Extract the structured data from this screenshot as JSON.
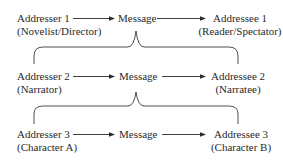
{
  "diagram": {
    "title": "",
    "levels": [
      {
        "addresser": {
          "name": "Addresser 1",
          "role": "(Novelist/Director)"
        },
        "message": "Message",
        "addressee": {
          "name": "Addressee 1",
          "role": "(Reader/Spectator)"
        }
      },
      {
        "addresser": {
          "name": "Addresser 2",
          "role": "(Narrator)"
        },
        "message": "Message",
        "addressee": {
          "name": "Addressee 2",
          "role": "(Narratee)"
        }
      },
      {
        "addresser": {
          "name": "Addresser 3",
          "role": "(Character A)"
        },
        "message": "Message",
        "addressee": {
          "name": "Addressee 3",
          "role": "(Character B)"
        }
      }
    ],
    "colors": {
      "text": "#2a2a2a",
      "lines": "#3a3a3a",
      "background": "#ffffff"
    }
  }
}
